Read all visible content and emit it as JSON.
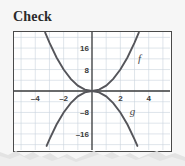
{
  "page": {
    "title": "Check",
    "background_color": "#f6f6f6"
  },
  "figure": {
    "frame_color": "#4a4a4a",
    "plot_background": "#ffffff",
    "grid_color": "#c9d4dd",
    "axis_color": "#3d3d3d",
    "curve_color": "#55555a"
  },
  "chart_data": {
    "type": "line",
    "title": "Check",
    "xlabel": "",
    "ylabel": "",
    "grid": true,
    "legend": "inline-curve-labels",
    "xlim": [
      -5.5,
      5.5
    ],
    "ylim": [
      -22,
      22
    ],
    "xticks": [
      -4,
      -2,
      2,
      4
    ],
    "xtick_labels": [
      "–4",
      "–2",
      "2",
      "4"
    ],
    "yticks": [
      16,
      8,
      -8,
      -16
    ],
    "ytick_labels": [
      "16",
      "8",
      "–8",
      "–16"
    ],
    "x_gridline_values": [
      -5,
      -4,
      -3,
      -2,
      -1,
      0,
      1,
      2,
      3,
      4,
      5
    ],
    "y_gridline_values": [
      -20,
      -16,
      -12,
      -8,
      -4,
      0,
      4,
      8,
      12,
      16,
      20
    ],
    "series": [
      {
        "name": "f",
        "label": "f",
        "equation": "y = 2x^2",
        "label_x": 3.35,
        "label_y": 11.0,
        "x": [
          -3.3,
          -3.0,
          -2.5,
          -2.0,
          -1.5,
          -1.0,
          -0.5,
          0,
          0.5,
          1.0,
          1.5,
          2.0,
          2.5,
          3.0,
          3.3
        ],
        "values": [
          21.8,
          18,
          12.5,
          8,
          4.5,
          2,
          0.5,
          0,
          0.5,
          2,
          4.5,
          8,
          12.5,
          18,
          21.8
        ]
      },
      {
        "name": "g",
        "label": "g",
        "equation": "y = -2x^2",
        "label_x": 2.85,
        "label_y": -9.0,
        "x": [
          -3.2,
          -3.0,
          -2.5,
          -2.0,
          -1.5,
          -1.0,
          -0.5,
          0,
          0.5,
          1.0,
          1.5,
          2.0,
          2.5,
          3.0,
          3.2
        ],
        "values": [
          -20.5,
          -18,
          -12.5,
          -8,
          -4.5,
          -2,
          -0.5,
          0,
          -0.5,
          -2,
          -4.5,
          -8,
          -12.5,
          -18,
          -20.5
        ]
      }
    ]
  }
}
